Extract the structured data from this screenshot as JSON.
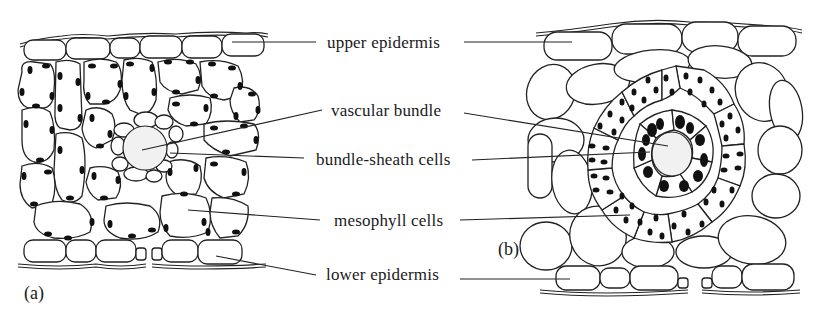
{
  "figure": {
    "panels": [
      {
        "id": "a",
        "label": "(a)"
      },
      {
        "id": "b",
        "label": "(b)"
      }
    ],
    "labels": [
      {
        "id": "upper-epidermis",
        "text": "upper epidermis"
      },
      {
        "id": "vascular-bundle",
        "text": "vascular bundle"
      },
      {
        "id": "bundle-sheath-cells",
        "text": "bundle-sheath cells"
      },
      {
        "id": "mesophyll-cells",
        "text": "mesophyll cells"
      },
      {
        "id": "lower-epidermis",
        "text": "lower epidermis"
      }
    ],
    "colors": {
      "ink": "#222222",
      "background": "#ffffff",
      "chloroplast": "#111111",
      "vascular_fill": "#f1f1f1"
    }
  }
}
